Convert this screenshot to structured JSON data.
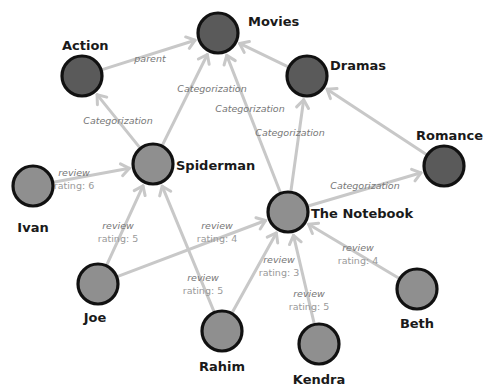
{
  "diagram": {
    "type": "property-graph",
    "colors": {
      "category_node": "#5a5a5a",
      "item_node": "#8f8f8f",
      "node_outline": "#111111",
      "edge": "#c8c8c8",
      "edge_label": "#777777"
    },
    "nodes": [
      {
        "id": "movies",
        "label": "Movies",
        "kind": "category"
      },
      {
        "id": "action",
        "label": "Action",
        "kind": "category"
      },
      {
        "id": "dramas",
        "label": "Dramas",
        "kind": "category"
      },
      {
        "id": "romance",
        "label": "Romance",
        "kind": "category"
      },
      {
        "id": "spiderman",
        "label": "Spiderman",
        "kind": "item"
      },
      {
        "id": "notebook",
        "label": "The Notebook",
        "kind": "item"
      },
      {
        "id": "ivan",
        "label": "Ivan",
        "kind": "item"
      },
      {
        "id": "joe",
        "label": "Joe",
        "kind": "item"
      },
      {
        "id": "rahim",
        "label": "Rahim",
        "kind": "item"
      },
      {
        "id": "kendra",
        "label": "Kendra",
        "kind": "item"
      },
      {
        "id": "beth",
        "label": "Beth",
        "kind": "item"
      }
    ],
    "edges": [
      {
        "from": "action",
        "to": "movies",
        "label": "parent",
        "sublabel": ""
      },
      {
        "from": "spiderman",
        "to": "movies",
        "label": "Categorization",
        "sublabel": ""
      },
      {
        "from": "spiderman",
        "to": "action",
        "label": "Categorization",
        "sublabel": ""
      },
      {
        "from": "notebook",
        "to": "movies",
        "label": "Categorization",
        "sublabel": ""
      },
      {
        "from": "notebook",
        "to": "dramas",
        "label": "Categorization",
        "sublabel": ""
      },
      {
        "from": "dramas",
        "to": "movies",
        "label": "",
        "sublabel": ""
      },
      {
        "from": "romance",
        "to": "dramas",
        "label": "",
        "sublabel": ""
      },
      {
        "from": "notebook",
        "to": "romance",
        "label": "Categorization",
        "sublabel": ""
      },
      {
        "from": "ivan",
        "to": "spiderman",
        "label": "review",
        "sublabel": "rating: 6"
      },
      {
        "from": "joe",
        "to": "spiderman",
        "label": "review",
        "sublabel": "rating: 5"
      },
      {
        "from": "joe",
        "to": "notebook",
        "label": "review",
        "sublabel": "rating: 4"
      },
      {
        "from": "rahim",
        "to": "spiderman",
        "label": "review",
        "sublabel": "rating: 5"
      },
      {
        "from": "rahim",
        "to": "notebook",
        "label": "review",
        "sublabel": "rating: 3"
      },
      {
        "from": "kendra",
        "to": "notebook",
        "label": "review",
        "sublabel": "rating: 5"
      },
      {
        "from": "beth",
        "to": "notebook",
        "label": "review",
        "sublabel": "rating: 4"
      }
    ]
  }
}
